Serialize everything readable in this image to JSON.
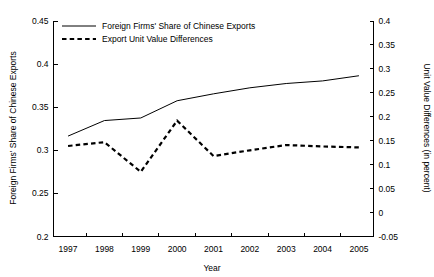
{
  "chart_data": {
    "type": "line",
    "title": "",
    "xlabel": "Year",
    "ylabel": "Foreign Firms' Share of Chinese Exports",
    "y2label": "Unit Value Differences (in percent)",
    "grid": false,
    "legend_position": "top-left",
    "x": [
      1997,
      1998,
      1999,
      2000,
      2001,
      2002,
      2003,
      2004,
      2005
    ],
    "xtick_labels": [
      "1997",
      "1998",
      "1999",
      "2000",
      "2001",
      "2002",
      "2003",
      "2004",
      "2005"
    ],
    "xlim": [
      1996.6,
      2005.4
    ],
    "ylim": [
      0.2,
      0.45
    ],
    "ytick_labels": [
      "0.2",
      "0.25",
      "0.3",
      "0.35",
      "0.4",
      "0.45"
    ],
    "ytick_values": [
      0.2,
      0.25,
      0.3,
      0.35,
      0.4,
      0.45
    ],
    "y2lim": [
      -0.05,
      0.4
    ],
    "y2tick_labels": [
      "-0.05",
      "0",
      "0.05",
      "0.1",
      "0.15",
      "0.2",
      "0.25",
      "0.3",
      "0.35",
      "0.4"
    ],
    "y2tick_values": [
      -0.05,
      0,
      0.05,
      0.1,
      0.15,
      0.2,
      0.25,
      0.3,
      0.35,
      0.4
    ],
    "series": [
      {
        "name": "Foreign Firms' Share of Chinese Exports",
        "axis": "left",
        "style": "solid",
        "values": [
          0.3165,
          0.3345,
          0.3375,
          0.3575,
          0.3655,
          0.3725,
          0.3775,
          0.3805,
          0.3865
        ]
      },
      {
        "name": "Export Unit Value Differences",
        "axis": "right",
        "style": "dashed",
        "values": [
          0.139,
          0.147,
          0.085,
          0.192,
          0.118,
          0.13,
          0.141,
          0.138,
          0.136
        ]
      }
    ],
    "legend": [
      {
        "label": "Foreign Firms' Share of Chinese Exports",
        "style": "solid"
      },
      {
        "label": "Export Unit Value Differences",
        "style": "dashed"
      }
    ]
  }
}
